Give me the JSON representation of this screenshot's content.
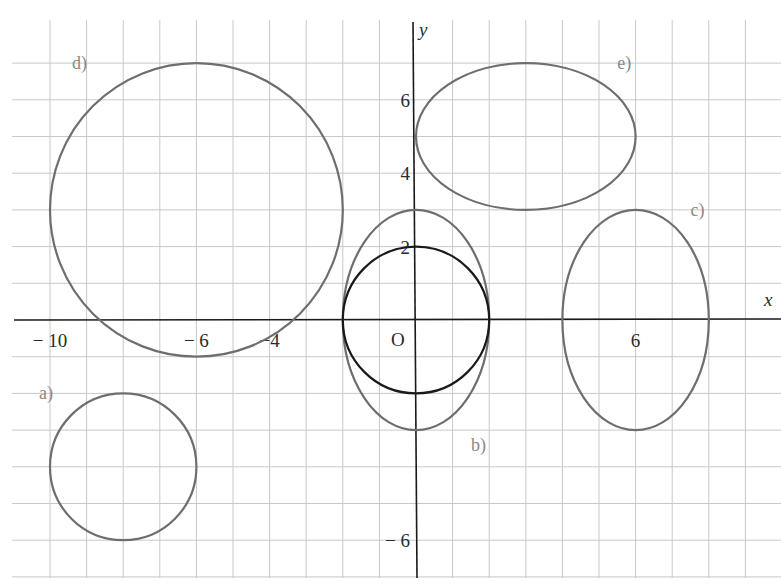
{
  "chart_data": {
    "type": "scatter",
    "title": "",
    "xlabel": "x",
    "ylabel": "y",
    "origin_label": "O",
    "xlim": [
      -11,
      9
    ],
    "ylim": [
      -7,
      8
    ],
    "grid": true,
    "x_tick_labels": [
      {
        "value": -10,
        "label": "− 10"
      },
      {
        "value": -6,
        "label": "− 6"
      },
      {
        "value": -4,
        "label": "−4"
      },
      {
        "value": 6,
        "label": "6"
      }
    ],
    "y_tick_labels": [
      {
        "value": 6,
        "label": "6"
      },
      {
        "value": 4,
        "label": "4"
      },
      {
        "value": 2,
        "label": "2"
      },
      {
        "value": -6,
        "label": "− 6"
      }
    ],
    "shapes": [
      {
        "label": "a)",
        "kind": "circle",
        "cx": -8,
        "cy": -4,
        "rx": 2,
        "ry": 2,
        "color": "#6e6e6e",
        "label_pos": [
          -10.3,
          -2
        ]
      },
      {
        "label": "b)",
        "kind": "ellipse",
        "cx": 0,
        "cy": 0,
        "rx": 2,
        "ry": 3,
        "color": "#6e6e6e",
        "label_pos": [
          1.5,
          -3.4
        ]
      },
      {
        "label": "",
        "kind": "circle",
        "cx": 0,
        "cy": 0,
        "rx": 2,
        "ry": 2,
        "color": "#1a1a1a",
        "label_pos": null
      },
      {
        "label": "c)",
        "kind": "ellipse",
        "cx": 6,
        "cy": 0,
        "rx": 2,
        "ry": 3,
        "color": "#6e6e6e",
        "label_pos": [
          7.5,
          3
        ]
      },
      {
        "label": "d)",
        "kind": "circle",
        "cx": -6,
        "cy": 3,
        "rx": 4,
        "ry": 4,
        "color": "#6e6e6e",
        "label_pos": [
          -9.4,
          7
        ]
      },
      {
        "label": "e)",
        "kind": "ellipse",
        "cx": 3,
        "cy": 5,
        "rx": 3,
        "ry": 2,
        "color": "#6e6e6e",
        "label_pos": [
          5.5,
          7
        ]
      }
    ]
  }
}
